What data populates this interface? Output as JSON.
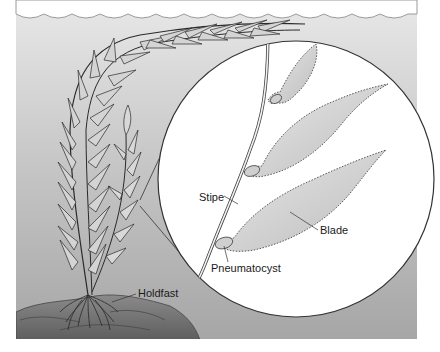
{
  "figure": {
    "labels": {
      "stipe": "Stipe",
      "blade": "Blade",
      "pneumatocyst": "Pneumatocyst",
      "holdfast": "Holdfast"
    }
  },
  "colors": {
    "water_top": "#e4e4e4",
    "water_bottom": "#a8a8a8",
    "inset_fill": "#ffffff",
    "outline": "#333333",
    "blade_fill": "#d2d2d2",
    "rock": "#7a7a7a"
  }
}
